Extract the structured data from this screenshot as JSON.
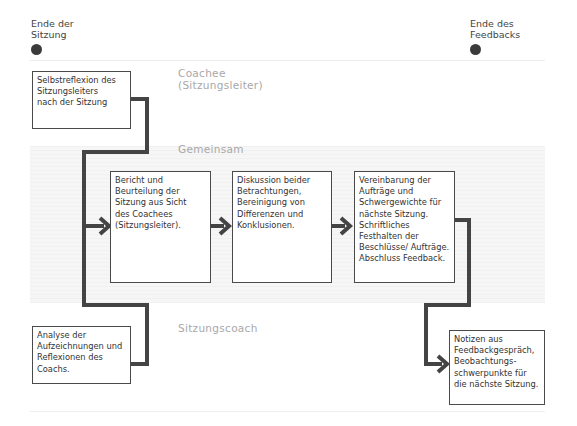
{
  "milestones": {
    "end_session": {
      "line1": "Ende der",
      "line2": "Sitzung"
    },
    "end_feedback": {
      "line1": "Ende des",
      "line2": "Feedbacks"
    }
  },
  "lanes": {
    "coachee": {
      "line1": "Coachee",
      "line2": "(Sitzungsleiter)"
    },
    "shared": {
      "label": "Gemeinsam"
    },
    "coach": {
      "label": "Sitzungscoach"
    }
  },
  "boxes": {
    "self_reflection": [
      "Selbstreflexion des",
      "Sitzungsleiters",
      "nach der Sitzung"
    ],
    "coach_analysis": [
      "Analyse der",
      "Aufzeichnungen und",
      "Reflexionen des",
      "Coachs."
    ],
    "report": [
      "Bericht und",
      "Beurteilung der",
      "Sitzung aus Sicht",
      "des Coachees",
      "(Sitzungsleiter)."
    ],
    "discussion": [
      "Diskussion beider",
      "Betrachtungen,",
      "Bereinigung von",
      "Differenzen und",
      "Konklusionen."
    ],
    "agreement": [
      "Vereinbarung der",
      "Aufträge und",
      "Schwergewichte für",
      "nächste Sitzung.",
      "Schriftliches",
      "Festhalten der",
      "Beschlüsse/ Aufträge.",
      "Abschluss Feedback."
    ],
    "notes": [
      "Notizen aus",
      "Feedbackgespräch,",
      "Beobachtungs-",
      "schwerpunkte für",
      "die nächste Sitzung."
    ]
  },
  "colors": {
    "connector": "#444444",
    "box_border": "#4a4a4a",
    "lane_label": "#a8a8a8",
    "shared_band": "#f6f6f6",
    "dot": "#3a3a3a"
  }
}
